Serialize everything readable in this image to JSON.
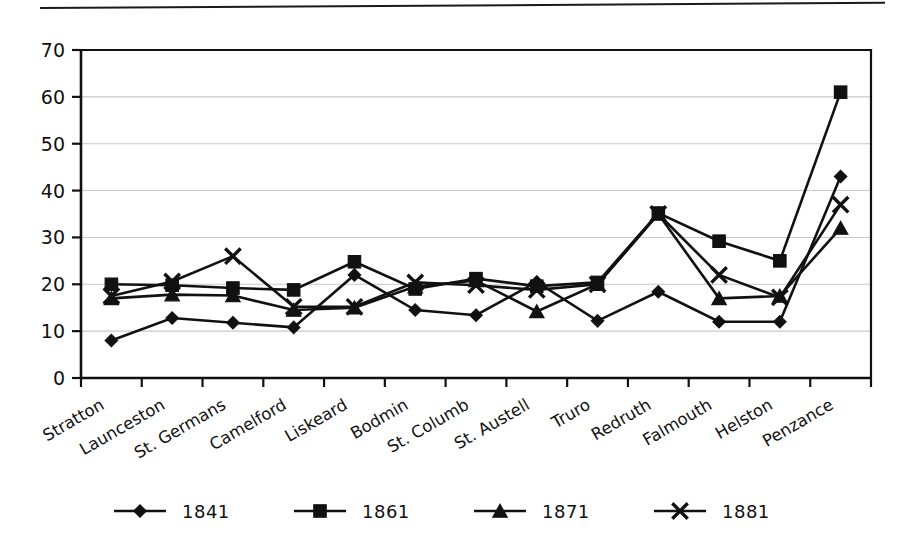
{
  "figure": {
    "has_top_rule": true,
    "background_color": "#ffffff",
    "ink_color": "#111111",
    "gridline_color": "#c9c9c9"
  },
  "chart_data": {
    "type": "line",
    "title": "",
    "subtitle": "",
    "xlabel": "",
    "ylabel": "",
    "categories": [
      "Stratton",
      "Launceston",
      "St. Germans",
      "Camelford",
      "Liskeard",
      "Bodmin",
      "St. Columb",
      "St. Austell",
      "Truro",
      "Redruth",
      "Falmouth",
      "Helston",
      "Penzance"
    ],
    "series": [
      {
        "name": "1841",
        "marker": "diamond",
        "color": "#111111",
        "values": [
          8,
          12.8,
          11.8,
          10.8,
          22,
          14.5,
          13.4,
          20.5,
          12.2,
          18.4,
          12,
          12,
          43
        ]
      },
      {
        "name": "1861",
        "marker": "square",
        "color": "#111111",
        "values": [
          20,
          19.8,
          19.2,
          18.8,
          24.8,
          19,
          21.2,
          19.6,
          20.4,
          35.2,
          29.2,
          25,
          61
        ]
      },
      {
        "name": "1871",
        "marker": "triangle",
        "color": "#111111",
        "values": [
          17,
          17.8,
          17.6,
          14.5,
          15,
          19.5,
          20.8,
          14.2,
          20,
          35,
          17,
          17.5,
          32
        ]
      },
      {
        "name": "1881",
        "marker": "x",
        "color": "#111111",
        "values": [
          17.5,
          20.6,
          26,
          15.2,
          15.2,
          20.4,
          19.8,
          18.8,
          20,
          35,
          22,
          17.2,
          37
        ]
      }
    ],
    "ylim": [
      0,
      70
    ],
    "yticks": [
      0,
      10,
      20,
      30,
      40,
      50,
      60,
      70
    ],
    "ytick_labels": [
      "0",
      "10",
      "20",
      "30",
      "40",
      "50",
      "60",
      "70"
    ],
    "grid": "horizontal",
    "legend_position": "bottom",
    "legend_entries": [
      "1841",
      "1861",
      "1871",
      "1881"
    ],
    "xtick_label_rotation_deg": -30
  }
}
